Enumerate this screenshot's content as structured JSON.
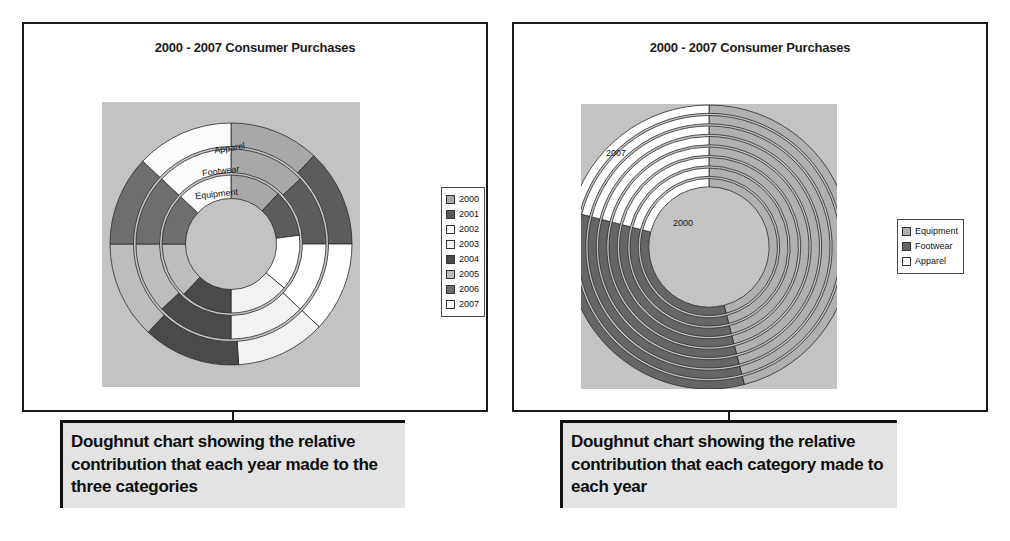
{
  "panels": [
    {
      "id": "left",
      "title": "2000 - 2007 Consumer Purchases",
      "caption": "Doughnut chart showing the relative contribution that each year made to the three categories",
      "ring_labels": [
        "Apparel",
        "Footwear",
        "Equipment"
      ],
      "legend": {
        "items": [
          {
            "label": "2000",
            "color": "#a8a8a8"
          },
          {
            "label": "2001",
            "color": "#5c5c5c"
          },
          {
            "label": "2002",
            "color": "#ffffff"
          },
          {
            "label": "2003",
            "color": "#f2f2f2"
          },
          {
            "label": "2004",
            "color": "#4a4a4a"
          },
          {
            "label": "2005",
            "color": "#bdbdbd"
          },
          {
            "label": "2006",
            "color": "#6e6e6e"
          },
          {
            "label": "2007",
            "color": "#fbfbfb"
          }
        ]
      }
    },
    {
      "id": "right",
      "title": "2000 - 2007 Consumer Purchases",
      "caption": "Doughnut chart showing the relative contribution that each category made to each year",
      "ring_labels": [
        "2007",
        "2000"
      ],
      "legend": {
        "items": [
          {
            "label": "Equipment",
            "color": "#b0b0b0"
          },
          {
            "label": "Footwear",
            "color": "#666666"
          },
          {
            "label": "Apparel",
            "color": "#ffffff"
          }
        ]
      }
    }
  ],
  "chart_data": [
    {
      "type": "pie",
      "subtype": "doughnut",
      "title": "2000 - 2007 Consumer Purchases",
      "description": "Doughnut chart showing the relative contribution that each year made to the three categories",
      "rings": [
        "Equipment",
        "Footwear",
        "Apparel"
      ],
      "ring_order": "inner-to-outer",
      "categories": [
        "2000",
        "2001",
        "2002",
        "2003",
        "2004",
        "2005",
        "2006",
        "2007"
      ],
      "series": [
        {
          "name": "Equipment",
          "values": [
            12,
            11,
            13,
            14,
            12,
            13,
            12,
            13
          ]
        },
        {
          "name": "Footwear",
          "values": [
            13,
            12,
            12,
            13,
            13,
            12,
            12,
            13
          ]
        },
        {
          "name": "Apparel",
          "values": [
            12,
            13,
            12,
            12,
            13,
            13,
            12,
            13
          ]
        }
      ],
      "legend_position": "right",
      "grid": false
    },
    {
      "type": "pie",
      "subtype": "doughnut",
      "title": "2000 - 2007 Consumer Purchases",
      "description": "Doughnut chart showing the relative contribution that each category made to each year",
      "rings": [
        "2000",
        "2001",
        "2002",
        "2003",
        "2004",
        "2005",
        "2006",
        "2007"
      ],
      "ring_order": "inner-to-outer",
      "categories": [
        "Equipment",
        "Footwear",
        "Apparel"
      ],
      "series": [
        {
          "name": "Equipment",
          "values": [
            46,
            46,
            46,
            46,
            46,
            46,
            46,
            46
          ]
        },
        {
          "name": "Footwear",
          "values": [
            33,
            33,
            33,
            33,
            33,
            33,
            33,
            33
          ]
        },
        {
          "name": "Apparel",
          "values": [
            21,
            21,
            21,
            21,
            21,
            21,
            21,
            21
          ]
        }
      ],
      "legend_position": "right",
      "grid": false
    }
  ],
  "colors": {
    "plot_background": "#c3c3c3",
    "caption_background": "#e3e3e3",
    "frame": "#1a1a1a"
  }
}
